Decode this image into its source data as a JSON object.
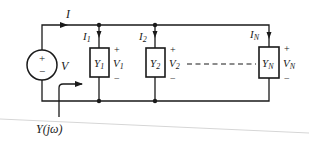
{
  "diagram": {
    "type": "parallel-admittance-circuit",
    "source": {
      "label": "V",
      "plus": "+",
      "minus": "−"
    },
    "total_current": {
      "label": "I"
    },
    "input_admittance": {
      "label": "Y(jω)"
    },
    "branches": [
      {
        "admittance": "Y",
        "admittance_sub": "1",
        "current": "I",
        "current_sub": "1",
        "voltage": "V",
        "voltage_sub": "1",
        "plus": "+",
        "minus": "−"
      },
      {
        "admittance": "Y",
        "admittance_sub": "2",
        "current": "I",
        "current_sub": "2",
        "voltage": "V",
        "voltage_sub": "2",
        "plus": "+",
        "minus": "−"
      },
      {
        "admittance": "Y",
        "admittance_sub": "N",
        "current": "I",
        "current_sub": "N",
        "voltage": "V",
        "voltage_sub": "N",
        "plus": "+",
        "minus": "−"
      }
    ],
    "colors": {
      "ink": "#1a1a1a",
      "page_edge": "#d6d6d6",
      "background": "#ffffff"
    }
  }
}
